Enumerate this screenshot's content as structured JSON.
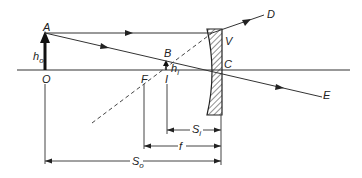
{
  "diagram": {
    "type": "ray-diagram-diverging-lens",
    "colors": {
      "ink": "#222222",
      "background": "#ffffff"
    },
    "labels": {
      "A": "A",
      "B": "B",
      "C": "C",
      "D": "D",
      "E": "E",
      "F": "F",
      "I": "I",
      "O": "O",
      "V": "V",
      "h_o": "h",
      "h_o_sub": "o",
      "h_i": "h",
      "h_i_sub": "i",
      "S_i": "S",
      "S_i_sub": "i",
      "f": "f",
      "S_o": "S",
      "S_o_sub": "o"
    }
  }
}
